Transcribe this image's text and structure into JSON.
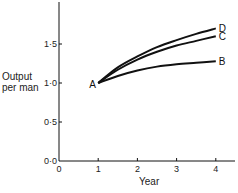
{
  "chart_data": {
    "type": "line",
    "title": "",
    "xlabel": "Year",
    "ylabel": "Output per man",
    "ylabel_lines": [
      "Output",
      "per man"
    ],
    "xlim": [
      0,
      4.5
    ],
    "ylim": [
      0,
      2.0
    ],
    "xticks": [
      0,
      1,
      2,
      3,
      4
    ],
    "xtick_labels": [
      "0",
      "1",
      "2",
      "3",
      "4"
    ],
    "yticks": [
      0,
      0.5,
      1.0,
      1.5
    ],
    "ytick_labels": [
      "0·0",
      "0·5",
      "1·0",
      "1·5"
    ],
    "grid": false,
    "legend": "inline labels at line ends",
    "start_point": {
      "label": "A",
      "x": 1,
      "y": 1.0
    },
    "series": [
      {
        "name": "D",
        "x": [
          1,
          1.5,
          2,
          2.5,
          3,
          3.5,
          4
        ],
        "values": [
          1.0,
          1.2,
          1.34,
          1.46,
          1.55,
          1.63,
          1.7
        ]
      },
      {
        "name": "C",
        "x": [
          1,
          1.5,
          2,
          2.5,
          3,
          3.5,
          4
        ],
        "values": [
          1.0,
          1.17,
          1.3,
          1.4,
          1.48,
          1.54,
          1.6
        ]
      },
      {
        "name": "B",
        "x": [
          1,
          1.5,
          2,
          2.5,
          3,
          3.5,
          4
        ],
        "values": [
          1.0,
          1.09,
          1.16,
          1.21,
          1.24,
          1.26,
          1.28
        ]
      }
    ],
    "line_color": "#111111"
  }
}
